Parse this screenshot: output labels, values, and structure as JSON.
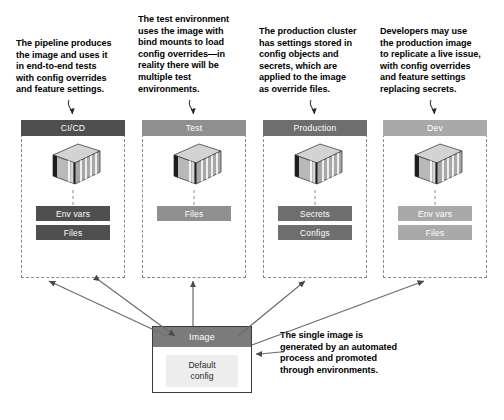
{
  "diagram": {
    "colors": {
      "cicd_header": "#4f4f4f",
      "test_header": "#8f8f8f",
      "production_header": "#6e6e6e",
      "dev_header": "#a9a9a9",
      "image_header": "#7b7b7b",
      "default_config_bg": "#ededed",
      "dashed_border": "#8a8a8a",
      "arrow": "#6b6b6b",
      "text": "#000000"
    },
    "annotations": [
      {
        "id": "cicd-note",
        "text": "The pipeline produces\nthe image and uses it\nin end-to-end tests\nwith config overrides\nand feature settings."
      },
      {
        "id": "test-note",
        "text": "The test environment\nuses the image with\nbind mounts to load\nconfig overrides—in\nreality there will be\nmultiple test\nenvironments."
      },
      {
        "id": "production-note",
        "text": "The production cluster\nhas settings stored in\nconfig objects and\nsecrets, which are\napplied to the image\nas override files."
      },
      {
        "id": "dev-note",
        "text": "Developers may use\nthe production image\nto replicate a live issue,\nwith config overrides\nand feature settings\nreplacing secrets."
      },
      {
        "id": "image-note",
        "text": "The single image is\ngenerated by an automated\nprocess and promoted\nthrough environments."
      }
    ],
    "environments": [
      {
        "id": "cicd",
        "label": "CI/CD",
        "header_color": "#4f4f4f",
        "item_color": "#4f4f4f",
        "items": [
          "Env vars",
          "Files"
        ]
      },
      {
        "id": "test",
        "label": "Test",
        "header_color": "#8f8f8f",
        "item_color": "#8f8f8f",
        "items": [
          "Files"
        ]
      },
      {
        "id": "production",
        "label": "Production",
        "header_color": "#6e6e6e",
        "item_color": "#6e6e6e",
        "items": [
          "Secrets",
          "Configs"
        ]
      },
      {
        "id": "dev",
        "label": "Dev",
        "header_color": "#a9a9a9",
        "item_color": "#a9a9a9",
        "items": [
          "Env vars",
          "Files"
        ]
      }
    ],
    "image_node": {
      "label": "Image",
      "default_config_line1": "Default",
      "default_config_line2": "config"
    }
  }
}
